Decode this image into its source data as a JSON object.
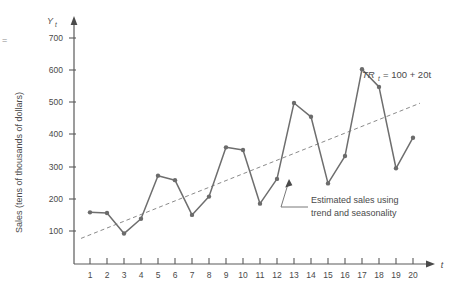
{
  "chart_data": {
    "type": "line",
    "title": "",
    "subtitle": "",
    "xlabel": "t",
    "ylabel": "Sales (tens of thousands of dollars)",
    "y_axis_symbol": "Yt",
    "x_axis_symbol": "t",
    "xlim": [
      0,
      21
    ],
    "ylim": [
      0,
      740
    ],
    "grid": false,
    "legend_position": "none",
    "y_ticks": [
      100,
      200,
      300,
      400,
      500,
      600,
      700
    ],
    "y_tick_labels": [
      "100",
      "200",
      "300",
      "400",
      "500",
      "600",
      "700"
    ],
    "x_ticks": [
      1,
      2,
      3,
      4,
      5,
      6,
      7,
      8,
      9,
      10,
      11,
      12,
      13,
      14,
      15,
      16,
      17,
      18,
      19,
      20
    ],
    "x_tick_labels": [
      "1",
      "2",
      "3",
      "4",
      "5",
      "6",
      "7",
      "8",
      "9",
      "10",
      "11",
      "12",
      "13",
      "14",
      "15",
      "16",
      "17",
      "18",
      "19",
      "20"
    ],
    "x": [
      1,
      2,
      3,
      4,
      5,
      6,
      7,
      8,
      9,
      10,
      11,
      12,
      13,
      14,
      15,
      16,
      17,
      18,
      19,
      20
    ],
    "series": [
      {
        "name": "Estimated sales using trend and seasonality",
        "kind": "line-with-markers",
        "color": "#6e6e6e",
        "values": [
          158,
          156,
          92,
          138,
          272,
          258,
          150,
          207,
          360,
          352,
          185,
          262,
          498,
          455,
          248,
          333,
          603,
          548,
          295,
          390
        ]
      },
      {
        "name": "TRt = 100 + 20t",
        "kind": "trend-dashed",
        "color": "#7d7d7d",
        "values": [
          120,
          140,
          160,
          180,
          200,
          220,
          240,
          260,
          280,
          300,
          320,
          340,
          360,
          380,
          400,
          420,
          440,
          460,
          480,
          500
        ]
      }
    ],
    "annotations": [
      {
        "name": "trend-equation",
        "text_prefix": "TR",
        "text_subscript": "t",
        "text_suffix": "= 100 + 20t",
        "full_text": "TRt = 100 + 20t"
      },
      {
        "name": "series-callout",
        "line1": "Estimated sales using",
        "line2": "trend and seasonality",
        "points_to_x": 15,
        "points_to_y": 248
      }
    ],
    "colors": {
      "series": "#6e6e6e",
      "trend": "#7d7d7d",
      "axis": "#5a5a5a",
      "text": "#4a4a4a",
      "background": "#ffffff"
    }
  },
  "margin_mark": {
    "symbol": "="
  }
}
